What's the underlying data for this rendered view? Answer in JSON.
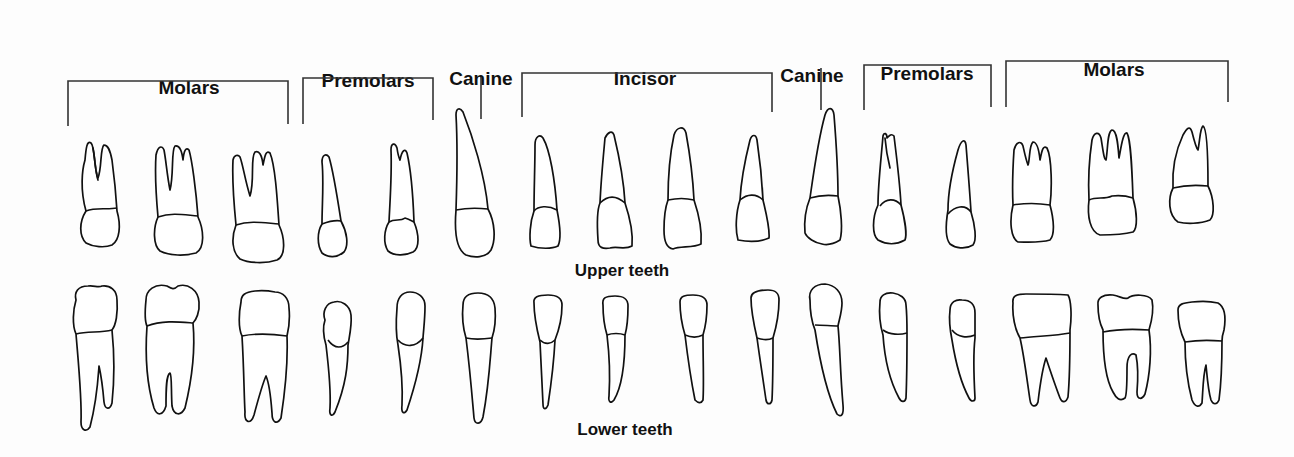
{
  "diagram": {
    "categories": [
      {
        "id": "molars-left",
        "label": "Molars"
      },
      {
        "id": "premolars-left",
        "label": "Premolars"
      },
      {
        "id": "canine-left",
        "label": "Canine"
      },
      {
        "id": "incisor",
        "label": "Incisor"
      },
      {
        "id": "canine-right",
        "label": "Canine"
      },
      {
        "id": "premolars-right",
        "label": "Premolars"
      },
      {
        "id": "molars-right",
        "label": "Molars"
      }
    ],
    "rows": {
      "upper": {
        "label": "Upper teeth",
        "count": 16
      },
      "lower": {
        "label": "Lower teeth",
        "count": 16
      }
    },
    "colors": {
      "stroke": "#111111",
      "background": "#fdfdfd"
    }
  }
}
